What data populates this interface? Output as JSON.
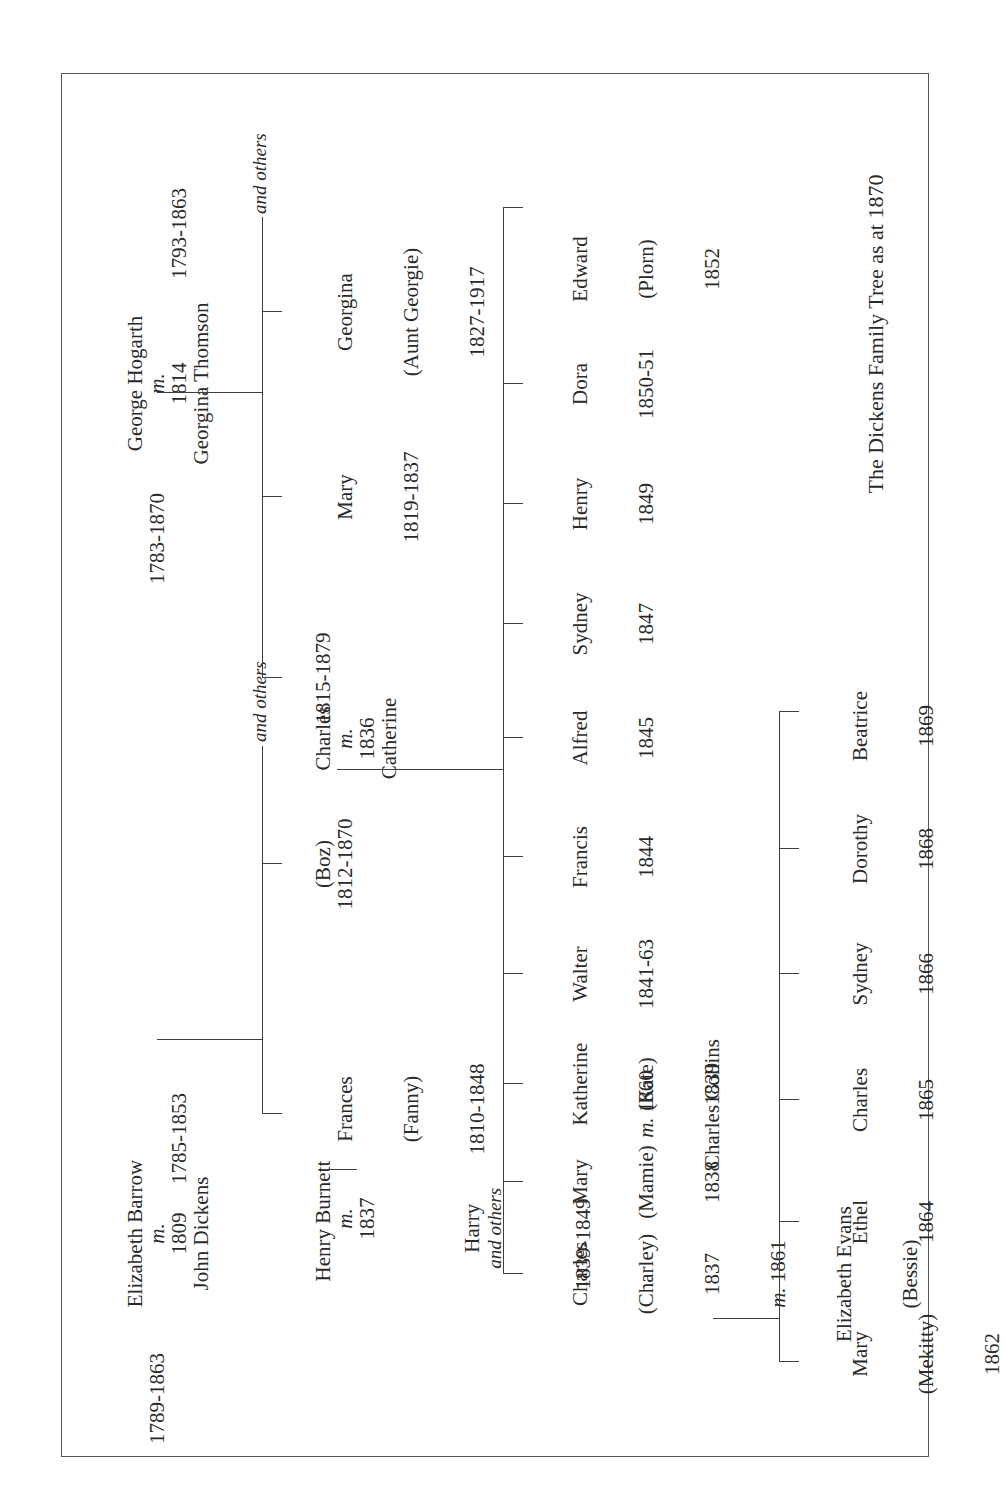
{
  "title": "The Dickens Family Tree as at 1870",
  "dickens_parents": {
    "wife": "Elizabeth Barrow",
    "marriage_prefix": "m.",
    "marriage_year": "1809",
    "husband": "John Dickens",
    "wife_dates": "1789-1863",
    "husband_dates": "1785-1853"
  },
  "hogarth_parents": {
    "husband": "George Hogarth",
    "marriage_prefix": "m.",
    "marriage_year": "1814",
    "wife": "Georgina Thomson",
    "husband_dates": "1783-1870",
    "wife_dates": "1793-1863"
  },
  "dickens_siblings": {
    "frances": {
      "name": "Frances",
      "nickname": "(Fanny)",
      "dates": "1810-1848"
    },
    "charles": {
      "name": "Charles",
      "marriage_prefix": "m.",
      "marriage_year": "1836",
      "nickname": "(Boz)",
      "dates": "1812-1870"
    },
    "others": "and others"
  },
  "hogarth_siblings": {
    "catherine": {
      "name": "Catherine",
      "dates": "1815-1879"
    },
    "mary": {
      "name": "Mary",
      "dates": "1819-1837"
    },
    "georgina": {
      "name": "Georgina",
      "nickname": "(Aunt Georgie)",
      "dates": "1827-1917"
    },
    "others": "and others"
  },
  "burnett": {
    "husband": "Henry Burnett",
    "marriage_prefix": "m.",
    "marriage_year": "1837",
    "child_name": "Harry",
    "child_suffix": "and others",
    "child_dates": "1839-1849"
  },
  "children": [
    {
      "name": "Charles",
      "nickname": "(Charley)",
      "dates": "1837",
      "marriage_prefix": "m.",
      "marriage_year": "1861",
      "spouse": "Elizabeth Evans",
      "spouse_nickname": "(Bessie)"
    },
    {
      "name": "Mary",
      "nickname": "(Mamie)",
      "dates": "1838"
    },
    {
      "name": "Katherine",
      "nickname": "(Kate)",
      "dates": "1839",
      "marriage_prefix": "m.",
      "marriage_year": "1860",
      "spouse": "Charles Collins"
    },
    {
      "name": "Walter",
      "dates": "1841-63"
    },
    {
      "name": "Francis",
      "dates": "1844"
    },
    {
      "name": "Alfred",
      "dates": "1845"
    },
    {
      "name": "Sydney",
      "dates": "1847"
    },
    {
      "name": "Henry",
      "dates": "1849"
    },
    {
      "name": "Dora",
      "dates": "1850-51"
    },
    {
      "name": "Edward",
      "nickname": "(Plorn)",
      "dates": "1852"
    }
  ],
  "grandchildren": [
    {
      "name": "Mary",
      "nickname": "(Mekitty)",
      "dates": "1862"
    },
    {
      "name": "Ethel",
      "dates": "1864"
    },
    {
      "name": "Charles",
      "dates": "1865"
    },
    {
      "name": "Sydney",
      "dates": "1866"
    },
    {
      "name": "Dorothy",
      "dates": "1868"
    },
    {
      "name": "Beatrice",
      "dates": "1869"
    }
  ],
  "colors": {
    "line": "#3f3f3f",
    "text": "#2a2a2a",
    "frame": "#555555",
    "background": "#ffffff"
  },
  "chart_data": {
    "type": "table",
    "title": "The Dickens Family Tree as at 1870",
    "nodes": [
      "Elizabeth Barrow 1789-1863",
      "John Dickens 1785-1853",
      "George Hogarth 1783-1870",
      "Georgina Thomson 1793-1863",
      "Frances (Fanny) 1810-1848",
      "Henry Burnett",
      "Harry 1839-1849",
      "Charles (Boz) 1812-1870",
      "Catherine 1815-1879",
      "Mary 1819-1837",
      "Georgina (Aunt Georgie) 1827-1917",
      "Charles (Charley) 1837",
      "Elizabeth Evans (Bessie)",
      "Mary (Mamie) 1838",
      "Katherine (Kate) 1839",
      "Charles Collins",
      "Walter 1841-63",
      "Francis 1844",
      "Alfred 1845",
      "Sydney 1847",
      "Henry 1849",
      "Dora 1850-51",
      "Edward (Plorn) 1852",
      "Mary (Mekitty) 1862",
      "Ethel 1864",
      "Charles 1865",
      "Sydney 1866",
      "Dorothy 1868",
      "Beatrice 1869"
    ],
    "marriages": [
      [
        "Elizabeth Barrow",
        "John Dickens",
        "1809"
      ],
      [
        "George Hogarth",
        "Georgina Thomson",
        "1814"
      ],
      [
        "Henry Burnett",
        "Frances",
        "1837"
      ],
      [
        "Charles",
        "Catherine",
        "1836"
      ],
      [
        "Charles (Charley)",
        "Elizabeth Evans",
        "1861"
      ],
      [
        "Katherine (Kate)",
        "Charles Collins",
        "1860"
      ]
    ]
  }
}
